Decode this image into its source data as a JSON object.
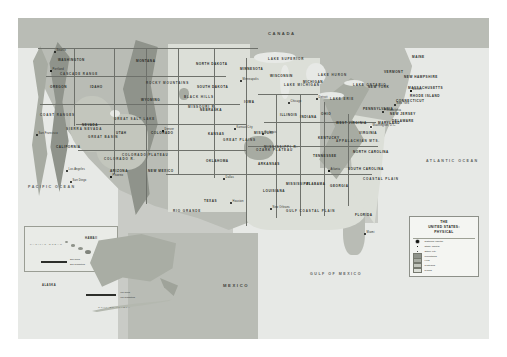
{
  "map": {
    "title": "THE UNITED STATES: PHYSICAL",
    "countries": [
      {
        "name": "CANADA",
        "x": 250,
        "y": 14
      },
      {
        "name": "MEXICO",
        "x": 205,
        "y": 266
      }
    ],
    "oceans": [
      {
        "name": "PACIFIC OCEAN",
        "x": 10,
        "y": 168
      },
      {
        "name": "ATLANTIC OCEAN",
        "x": 408,
        "y": 142
      },
      {
        "name": "GULF OF MEXICO",
        "x": 292,
        "y": 255
      }
    ],
    "states": [
      {
        "name": "WASHINGTON",
        "x": 40,
        "y": 41
      },
      {
        "name": "OREGON",
        "x": 32,
        "y": 68
      },
      {
        "name": "IDAHO",
        "x": 72,
        "y": 68
      },
      {
        "name": "MONTANA",
        "x": 118,
        "y": 42
      },
      {
        "name": "WYOMING",
        "x": 123,
        "y": 81
      },
      {
        "name": "NORTH DAKOTA",
        "x": 178,
        "y": 45
      },
      {
        "name": "SOUTH DAKOTA",
        "x": 179,
        "y": 68
      },
      {
        "name": "NEBRASKA",
        "x": 182,
        "y": 91
      },
      {
        "name": "KANSAS",
        "x": 190,
        "y": 115
      },
      {
        "name": "OKLAHOMA",
        "x": 188,
        "y": 142
      },
      {
        "name": "TEXAS",
        "x": 186,
        "y": 182
      },
      {
        "name": "MINNESOTA",
        "x": 222,
        "y": 50
      },
      {
        "name": "IOWA",
        "x": 226,
        "y": 83
      },
      {
        "name": "MISSOURI",
        "x": 236,
        "y": 114
      },
      {
        "name": "ARKANSAS",
        "x": 240,
        "y": 145
      },
      {
        "name": "LOUISIANA",
        "x": 245,
        "y": 172
      },
      {
        "name": "WISCONSIN",
        "x": 252,
        "y": 57
      },
      {
        "name": "ILLINOIS",
        "x": 262,
        "y": 96
      },
      {
        "name": "MICHIGAN",
        "x": 285,
        "y": 63
      },
      {
        "name": "INDIANA",
        "x": 282,
        "y": 98
      },
      {
        "name": "OHIO",
        "x": 303,
        "y": 95
      },
      {
        "name": "KENTUCKY",
        "x": 300,
        "y": 119
      },
      {
        "name": "TENNESSEE",
        "x": 295,
        "y": 137
      },
      {
        "name": "MISSISSIPPI",
        "x": 268,
        "y": 165
      },
      {
        "name": "ALABAMA",
        "x": 288,
        "y": 165
      },
      {
        "name": "GEORGIA",
        "x": 312,
        "y": 167
      },
      {
        "name": "FLORIDA",
        "x": 337,
        "y": 196
      },
      {
        "name": "SOUTH CAROLINA",
        "x": 330,
        "y": 150
      },
      {
        "name": "NORTH CAROLINA",
        "x": 335,
        "y": 133
      },
      {
        "name": "VIRGINIA",
        "x": 341,
        "y": 114
      },
      {
        "name": "WEST VIRGINIA",
        "x": 318,
        "y": 104
      },
      {
        "name": "PENNSYLVANIA",
        "x": 345,
        "y": 90
      },
      {
        "name": "NEW YORK",
        "x": 350,
        "y": 68
      },
      {
        "name": "MAINE",
        "x": 394,
        "y": 38
      },
      {
        "name": "VERMONT",
        "x": 366,
        "y": 53
      },
      {
        "name": "NEW HAMPSHIRE",
        "x": 386,
        "y": 58
      },
      {
        "name": "MASSACHUSETTS",
        "x": 390,
        "y": 69
      },
      {
        "name": "RHODE ISLAND",
        "x": 392,
        "y": 77
      },
      {
        "name": "CONNECTICUT",
        "x": 378,
        "y": 82
      },
      {
        "name": "NEW JERSEY",
        "x": 372,
        "y": 95
      },
      {
        "name": "DELAWARE",
        "x": 374,
        "y": 102
      },
      {
        "name": "MARYLAND",
        "x": 360,
        "y": 104
      },
      {
        "name": "COLORADO",
        "x": 133,
        "y": 114
      },
      {
        "name": "NEW MEXICO",
        "x": 130,
        "y": 152
      },
      {
        "name": "ARIZONA",
        "x": 92,
        "y": 152
      },
      {
        "name": "UTAH",
        "x": 98,
        "y": 114
      },
      {
        "name": "NEVADA",
        "x": 64,
        "y": 106
      },
      {
        "name": "CALIFORNIA",
        "x": 38,
        "y": 128
      }
    ],
    "physical_features": [
      {
        "name": "ROCKY MOUNTAINS",
        "x": 128,
        "y": 64
      },
      {
        "name": "GREAT PLAINS",
        "x": 205,
        "y": 121
      },
      {
        "name": "APPALACHIAN MTS.",
        "x": 318,
        "y": 122
      },
      {
        "name": "COASTAL PLAIN",
        "x": 345,
        "y": 160
      },
      {
        "name": "GULF COASTAL PLAIN",
        "x": 268,
        "y": 192
      },
      {
        "name": "BLACK HILLS",
        "x": 166,
        "y": 78
      },
      {
        "name": "GREAT BASIN",
        "x": 70,
        "y": 118
      },
      {
        "name": "COLORADO PLATEAU",
        "x": 104,
        "y": 136
      },
      {
        "name": "SIERRA NEVADA",
        "x": 48,
        "y": 110
      },
      {
        "name": "CASCADE RANGE",
        "x": 42,
        "y": 55
      },
      {
        "name": "COAST RANGES",
        "x": 22,
        "y": 96
      },
      {
        "name": "OZARK PLATEAU",
        "x": 238,
        "y": 131
      },
      {
        "name": "GREAT SALT LAKE",
        "x": 96,
        "y": 100
      },
      {
        "name": "LAKE SUPERIOR",
        "x": 250,
        "y": 40
      },
      {
        "name": "LAKE MICHIGAN",
        "x": 266,
        "y": 66
      },
      {
        "name": "LAKE HURON",
        "x": 300,
        "y": 56
      },
      {
        "name": "LAKE ERIE",
        "x": 312,
        "y": 80
      },
      {
        "name": "LAKE ONTARIO",
        "x": 335,
        "y": 66
      },
      {
        "name": "MISSISSIPPI R.",
        "x": 246,
        "y": 128
      },
      {
        "name": "MISSOURI R.",
        "x": 170,
        "y": 88
      },
      {
        "name": "RIO GRANDE",
        "x": 155,
        "y": 192
      },
      {
        "name": "COLORADO R.",
        "x": 86,
        "y": 140
      }
    ],
    "cities": [
      {
        "name": "Seattle",
        "x": 36,
        "y": 33,
        "type": "other"
      },
      {
        "name": "Portland",
        "x": 32,
        "y": 52,
        "type": "state"
      },
      {
        "name": "San Francisco",
        "x": 18,
        "y": 116,
        "type": "other"
      },
      {
        "name": "Los Angeles",
        "x": 48,
        "y": 152,
        "type": "other"
      },
      {
        "name": "San Diego",
        "x": 52,
        "y": 163,
        "type": "other"
      },
      {
        "name": "Phoenix",
        "x": 92,
        "y": 158,
        "type": "state"
      },
      {
        "name": "Denver",
        "x": 144,
        "y": 112,
        "type": "state"
      },
      {
        "name": "Dallas",
        "x": 205,
        "y": 160,
        "type": "other"
      },
      {
        "name": "Houston",
        "x": 212,
        "y": 184,
        "type": "other"
      },
      {
        "name": "Kansas City",
        "x": 216,
        "y": 110,
        "type": "other"
      },
      {
        "name": "St. Louis",
        "x": 244,
        "y": 115,
        "type": "other"
      },
      {
        "name": "Chicago",
        "x": 270,
        "y": 84,
        "type": "other"
      },
      {
        "name": "Detroit",
        "x": 298,
        "y": 80,
        "type": "other"
      },
      {
        "name": "Minneapolis",
        "x": 222,
        "y": 62,
        "type": "other"
      },
      {
        "name": "New Orleans",
        "x": 252,
        "y": 190,
        "type": "other"
      },
      {
        "name": "Miami",
        "x": 346,
        "y": 215,
        "type": "other"
      },
      {
        "name": "Atlanta",
        "x": 310,
        "y": 152,
        "type": "state"
      },
      {
        "name": "Washington, D.C.",
        "x": 352,
        "y": 108,
        "type": "national"
      },
      {
        "name": "Philadelphia",
        "x": 364,
        "y": 93,
        "type": "other"
      },
      {
        "name": "New York",
        "x": 376,
        "y": 86,
        "type": "other"
      },
      {
        "name": "Boston",
        "x": 392,
        "y": 72,
        "type": "state"
      }
    ]
  },
  "legend": {
    "title_line1": "THE",
    "title_line2": "UNITED STATES:",
    "title_line3": "PHYSICAL",
    "point_items": [
      {
        "symbol": "star",
        "label": "National capital"
      },
      {
        "symbol": "square",
        "label": "State capital"
      },
      {
        "symbol": "dot",
        "label": "Other city"
      }
    ],
    "area_items": [
      {
        "label": "Mountains",
        "color": "#8f938b"
      },
      {
        "label": "Hills",
        "color": "#a7aba2"
      },
      {
        "label": "Plateaus",
        "color": "#c3c6bd"
      },
      {
        "label": "Plains",
        "color": "#dcdfd8"
      }
    ]
  },
  "insets": {
    "hawaii": {
      "label": "HAWAII",
      "ocean_label": "PACIFIC OCEAN",
      "scale_miles": "200 miles",
      "scale_km": "200 kilometers"
    },
    "alaska": {
      "label": "ALASKA",
      "ocean_label": "ARCTIC OCEAN",
      "sea_label": "GULF OF ALASKA",
      "scale_miles": "400 miles",
      "scale_km": "400 kilometers"
    }
  }
}
